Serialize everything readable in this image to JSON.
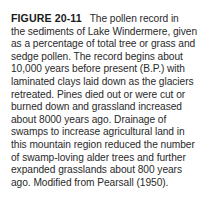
{
  "caption": {
    "label": "FIGURE 20-11",
    "lines": [
      "The pollen record in",
      "the sediments of Lake Windermere, given",
      "as a percentage of total tree or grass and",
      "sedge pollen. The record begins about",
      "10,000 years before present (B.P.) with",
      "laminated clays laid down as the glaciers",
      "retreated. Pines died out or were cut or",
      "burned down and grassland increased",
      "about 8000 years ago. Drainage of",
      "swamps to increase agricultural land in",
      "this mountain region reduced the number",
      "of swamp-loving alder trees and further",
      "expanded grasslands about 800 years",
      "ago. Modified from Pearsall (1950)."
    ]
  }
}
